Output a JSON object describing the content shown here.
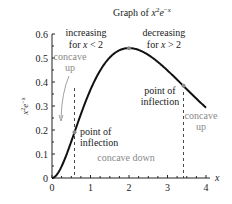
{
  "chart_data": {
    "type": "line",
    "xlabel": "x",
    "ylabel": "x²e⁻ˣ",
    "xlim": [
      0,
      4.2
    ],
    "ylim": [
      0,
      0.6
    ],
    "xticks": [
      0,
      1,
      2,
      3,
      4
    ],
    "yticks": [
      0,
      0.1,
      0.2,
      0.3,
      0.4,
      0.5,
      0.6
    ],
    "xtick_labels": [
      "0",
      "1",
      "2",
      "3",
      "4"
    ],
    "ytick_labels": [
      "0",
      "0.1",
      "0.2",
      "0.3",
      "0.4",
      "0.5",
      "0.6"
    ],
    "series": [
      {
        "name": "x^2 e^-x",
        "function": "x^2*exp(-x)",
        "domain": [
          0,
          4
        ],
        "x": [
          0,
          0.25,
          0.5,
          0.586,
          0.75,
          1,
          1.25,
          1.5,
          1.75,
          2,
          2.25,
          2.5,
          2.75,
          3,
          3.25,
          3.414,
          3.5,
          3.75,
          4
        ],
        "values": [
          0,
          0.049,
          0.152,
          0.191,
          0.266,
          0.368,
          0.448,
          0.502,
          0.531,
          0.541,
          0.534,
          0.513,
          0.485,
          0.448,
          0.409,
          0.384,
          0.371,
          0.33,
          0.293
        ]
      }
    ],
    "points": [
      {
        "label": "maximum",
        "x": 2,
        "y": 0.541
      },
      {
        "label": "point of inflection",
        "x": 0.586,
        "y": 0.191
      },
      {
        "label": "point of inflection",
        "x": 3.414,
        "y": 0.384
      }
    ],
    "vlines": [
      0.586,
      3.414
    ],
    "annotations": {
      "increasing_1": "increasing",
      "increasing_2": "for x < 2",
      "decreasing_1": "decreasing",
      "decreasing_2": "for x > 2",
      "concave_up_left_1": "concave",
      "concave_up_left_2": "up",
      "inflection_left_1": "point of",
      "inflection_left_2": "inflection",
      "inflection_right_1": "point of",
      "inflection_right_2": "inflection",
      "concave_down": "concave down",
      "concave_up_right_1": "concave",
      "concave_up_right_2": "up"
    },
    "grid": false,
    "legend": "none"
  }
}
